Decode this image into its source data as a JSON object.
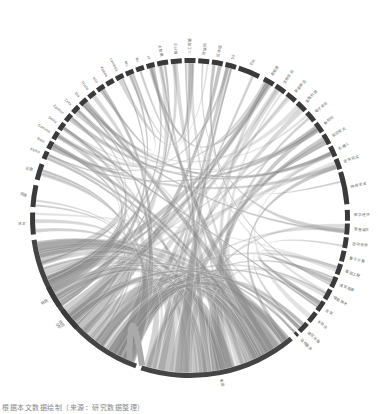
{
  "diagram": {
    "type": "chord",
    "center": [
      190,
      218
    ],
    "radius": 160,
    "arc_color": "#3a3a3a",
    "chord_color": "#8a8a8a",
    "groups": [
      {
        "label": "中国",
        "start": 200,
        "end": 262,
        "major": true
      },
      {
        "label": "美国",
        "start": 140,
        "end": 198,
        "major": true
      },
      {
        "label": "日本",
        "start": 264,
        "end": 272
      },
      {
        "label": "韩国",
        "start": 236,
        "end": 244
      },
      {
        "label": "德国",
        "start": 226,
        "end": 234
      },
      {
        "label": "英国",
        "start": 274,
        "end": 282
      },
      {
        "label": "法国",
        "start": 284,
        "end": 290
      },
      {
        "label": "Alpha",
        "start": 292,
        "end": 295
      },
      {
        "label": "Beta",
        "start": 296,
        "end": 299
      },
      {
        "label": "Gamma",
        "start": 300,
        "end": 303
      },
      {
        "label": "Delta",
        "start": 304,
        "end": 307
      },
      {
        "label": "Epsilon",
        "start": 308,
        "end": 311
      },
      {
        "label": "Zeta",
        "start": 312,
        "end": 315
      },
      {
        "label": "Eta",
        "start": 316,
        "end": 319
      },
      {
        "label": "Theta",
        "start": 320,
        "end": 323
      },
      {
        "label": "Iota",
        "start": 324,
        "end": 327
      },
      {
        "label": "Kappa",
        "start": 328,
        "end": 331
      },
      {
        "label": "Lambda",
        "start": 332,
        "end": 335
      },
      {
        "label": "Mu",
        "start": 336,
        "end": 339
      },
      {
        "label": "Nu",
        "start": 340,
        "end": 343
      },
      {
        "label": "Xi",
        "start": 344,
        "end": 347
      },
      {
        "label": "大数据",
        "start": 348,
        "end": 352
      },
      {
        "label": "云计算",
        "start": 353,
        "end": 357
      },
      {
        "label": "人工智能",
        "start": 358,
        "end": 362
      },
      {
        "label": "物联网",
        "start": 363,
        "end": 367
      },
      {
        "label": "区块链",
        "start": 368,
        "end": 372
      },
      {
        "label": "5G",
        "start": 373,
        "end": 377
      },
      {
        "label": "芯片",
        "start": 378,
        "end": 386
      },
      {
        "label": "新能源",
        "start": 388,
        "end": 392
      },
      {
        "label": "生物医药",
        "start": 393,
        "end": 397
      },
      {
        "label": "智能制造",
        "start": 398,
        "end": 402
      },
      {
        "label": "金融科技",
        "start": 403,
        "end": 407
      },
      {
        "label": "电子商务",
        "start": 408,
        "end": 412
      },
      {
        "label": "新材料",
        "start": 413,
        "end": 417
      },
      {
        "label": "航空航天",
        "start": 418,
        "end": 422
      },
      {
        "label": "机器人",
        "start": 423,
        "end": 427
      },
      {
        "label": "虚拟现实",
        "start": 428,
        "end": 432
      },
      {
        "label": "网络安全",
        "start": 433,
        "end": 445
      },
      {
        "label": "数字经济",
        "start": 447,
        "end": 451
      },
      {
        "label": "智慧城市",
        "start": 452,
        "end": 456
      },
      {
        "label": "自动驾驶",
        "start": 457,
        "end": 461
      },
      {
        "label": "量子计算",
        "start": 462,
        "end": 466
      },
      {
        "label": "基因工程",
        "start": 467,
        "end": 471
      },
      {
        "label": "清洁能源",
        "start": 472,
        "end": 476
      },
      {
        "label": "储能技术",
        "start": 477,
        "end": 481
      },
      {
        "label": "光伏",
        "start": 482,
        "end": 486
      },
      {
        "label": "半导体",
        "start": 487,
        "end": 491
      },
      {
        "label": "通信设备",
        "start": 492,
        "end": 496
      },
      {
        "label": "软件服务",
        "start": 497,
        "end": 498
      }
    ]
  },
  "caption": "根据本文数据绘制（来源：研究数据整理）"
}
